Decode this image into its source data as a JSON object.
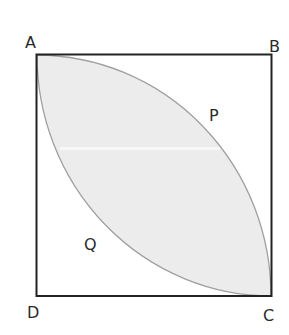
{
  "diagram": {
    "type": "geometry",
    "square": {
      "vertices": {
        "A": "top-left",
        "B": "top-right",
        "C": "bottom-right",
        "D": "bottom-left"
      }
    },
    "labels": {
      "A": "A",
      "B": "B",
      "C": "C",
      "D": "D",
      "P": "P",
      "Q": "Q"
    },
    "arcs": [
      {
        "name": "P",
        "from": "A",
        "to": "C",
        "center": "D"
      },
      {
        "name": "Q",
        "from": "A",
        "to": "C",
        "center": "B"
      }
    ],
    "colors": {
      "square_stroke": "#222222",
      "arc_stroke": "#a0a0a0",
      "shaded_fill": "#ececec",
      "label": "#2a2a2a"
    }
  }
}
